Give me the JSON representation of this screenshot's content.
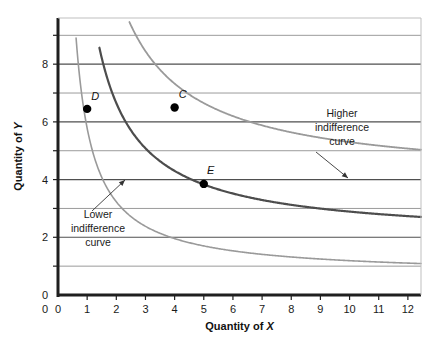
{
  "chart_data": {
    "type": "line",
    "title": "",
    "xlabel": "Quantity of X",
    "ylabel": "Quantity of Y",
    "xlim": [
      0,
      12.45
    ],
    "ylim": [
      0,
      9.6
    ],
    "xticks": [
      0,
      1,
      2,
      3,
      4,
      5,
      6,
      7,
      8,
      9,
      10,
      11,
      12
    ],
    "xtick_labels": [
      "0",
      "1",
      "2",
      "3",
      "4",
      "5",
      "6",
      "7",
      "8",
      "9",
      "10",
      "11",
      "12"
    ],
    "yticks": [
      0,
      1,
      2,
      3,
      4,
      5,
      6,
      7,
      8,
      9
    ],
    "ytick_labels": [
      "0",
      "",
      "2",
      "",
      "4",
      "",
      "6",
      "",
      "8",
      ""
    ],
    "ylabeled_ticks": [
      0,
      2,
      4,
      6,
      8
    ],
    "grid": "horizontal",
    "grid_color": "#808080",
    "series": [
      {
        "name": "Lower indifference curve",
        "color": "#9a9a9a",
        "width": 1.6,
        "asymptote_y": 0.68,
        "k": 5.1,
        "x_start": 0.62,
        "x_end": 12.45
      },
      {
        "name": "Middle indifference curve",
        "color": "#4d4d4d",
        "width": 2.2,
        "asymptote_y": 1.95,
        "k": 9.4,
        "x_start": 1.42,
        "x_end": 12.45
      },
      {
        "name": "Higher indifference curve",
        "color": "#9a9a9a",
        "width": 1.8,
        "asymptote_y": 3.95,
        "k": 13.5,
        "x_start": 2.45,
        "x_end": 12.45
      }
    ],
    "points": [
      {
        "label": "D",
        "x": 1.0,
        "y": 6.45,
        "label_dx": 8,
        "label_dy": -9
      },
      {
        "label": "C",
        "x": 4.0,
        "y": 6.5,
        "label_dx": 8,
        "label_dy": -9
      },
      {
        "label": "E",
        "x": 5.0,
        "y": 3.85,
        "label_dx": 7,
        "label_dy": -10
      }
    ],
    "point_color": "#000000",
    "point_radius": 4.2,
    "annotations": [
      {
        "name": "higher-indifference-curve-annotation",
        "lines": [
          "Higher",
          "indifference",
          "curve"
        ],
        "text_x": 342,
        "text_y": 117,
        "arrow_from_x": 316,
        "arrow_from_y": 152,
        "arrow_to_x": 348,
        "arrow_to_y": 178
      },
      {
        "name": "lower-indifference-curve-annotation",
        "lines": [
          "Lower",
          "indifference",
          "curve"
        ],
        "text_x": 98,
        "text_y": 218,
        "arrow_from_x": 92,
        "arrow_from_y": 211,
        "arrow_to_x": 125,
        "arrow_to_y": 180
      }
    ]
  }
}
